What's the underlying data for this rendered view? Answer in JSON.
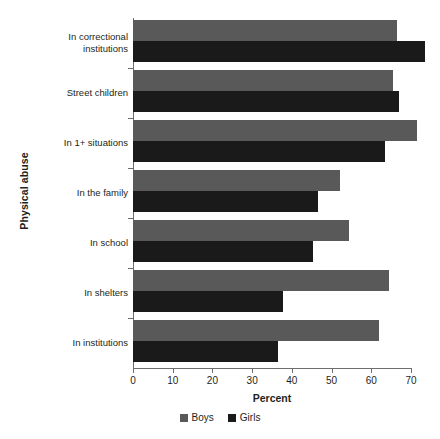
{
  "chart_data": {
    "type": "bar",
    "orientation": "horizontal",
    "title": "",
    "xlabel": "Percent",
    "ylabel": "Physical abuse",
    "xlim": [
      0,
      70
    ],
    "xticks": [
      0,
      10,
      20,
      30,
      40,
      50,
      60,
      70
    ],
    "grid": false,
    "legend_position": "bottom",
    "categories": [
      "In correctional institutions",
      "Street children",
      "In 1+ situations",
      "In the family",
      "In school",
      "In shelters",
      "In institutions"
    ],
    "series": [
      {
        "name": "Boys",
        "color": "#595959",
        "values": [
          66.5,
          65.5,
          71.5,
          52.0,
          54.5,
          64.5,
          62.0
        ]
      },
      {
        "name": "Girls",
        "color": "#1a1a1a",
        "values": [
          73.5,
          67.0,
          63.5,
          46.5,
          45.3,
          37.8,
          36.5
        ]
      }
    ]
  },
  "labels": {
    "category_lines": [
      [
        "In correctional",
        "institutions"
      ],
      [
        "Street children"
      ],
      [
        "In 1+ situations"
      ],
      [
        "In the family"
      ],
      [
        "In school"
      ],
      [
        "In shelters"
      ],
      [
        "In institutions"
      ]
    ],
    "xtick_texts": [
      "0",
      "10",
      "20",
      "30",
      "40",
      "50",
      "60",
      "70"
    ]
  },
  "legend": {
    "items": [
      {
        "label": "Boys",
        "color": "#595959"
      },
      {
        "label": "Girls",
        "color": "#1a1a1a"
      }
    ]
  }
}
